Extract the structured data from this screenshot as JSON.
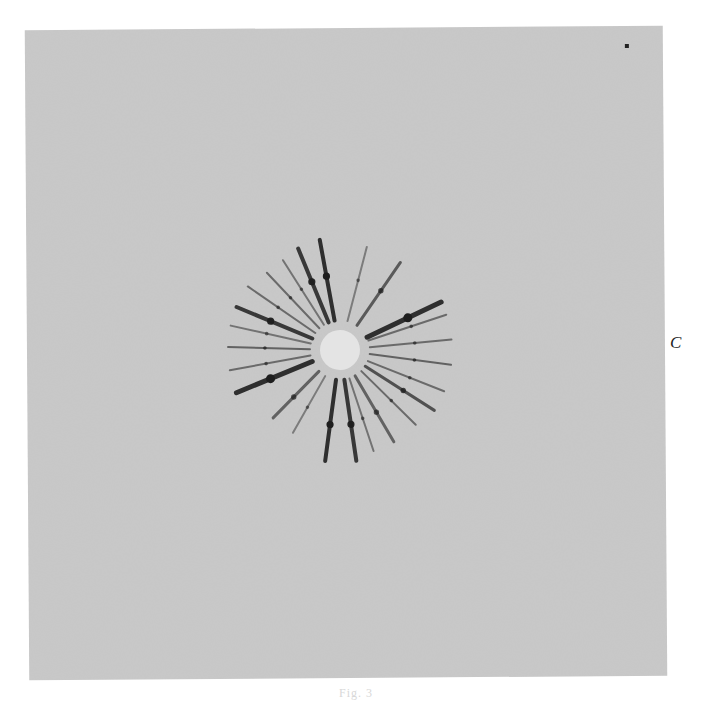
{
  "figure": {
    "side_label": "C",
    "caption": "Fig. 3",
    "plate_color": "#c9c9c9",
    "streak_color": "#1e1e1e",
    "pattern": {
      "center_x": 313,
      "center_y": 322,
      "inner_radius": 22,
      "outer_radius": 112,
      "streaks": [
        {
          "angle": -100,
          "len": 1.0,
          "w": 4,
          "o": 0.9
        },
        {
          "angle": -112,
          "len": 0.98,
          "w": 4,
          "o": 0.85
        },
        {
          "angle": -122,
          "len": 0.95,
          "w": 2,
          "o": 0.5
        },
        {
          "angle": -133,
          "len": 0.95,
          "w": 2,
          "o": 0.55
        },
        {
          "angle": -145,
          "len": 1.0,
          "w": 2,
          "o": 0.55
        },
        {
          "angle": -157,
          "len": 1.0,
          "w": 4,
          "o": 0.85
        },
        {
          "angle": -167,
          "len": 1.0,
          "w": 2,
          "o": 0.5
        },
        {
          "angle": -178,
          "len": 1.0,
          "w": 2,
          "o": 0.6
        },
        {
          "angle": 170,
          "len": 1.0,
          "w": 2,
          "o": 0.55
        },
        {
          "angle": 158,
          "len": 1.0,
          "w": 5,
          "o": 0.9
        },
        {
          "angle": 135,
          "len": 0.85,
          "w": 3,
          "o": 0.6
        },
        {
          "angle": 120,
          "len": 0.85,
          "w": 2,
          "o": 0.45
        },
        {
          "angle": 98,
          "len": 1.0,
          "w": 4,
          "o": 0.9
        },
        {
          "angle": 82,
          "len": 1.0,
          "w": 4,
          "o": 0.85
        },
        {
          "angle": 72,
          "len": 0.95,
          "w": 2,
          "o": 0.5
        },
        {
          "angle": 60,
          "len": 0.95,
          "w": 3,
          "o": 0.6
        },
        {
          "angle": 45,
          "len": 0.95,
          "w": 2,
          "o": 0.55
        },
        {
          "angle": 33,
          "len": 1.0,
          "w": 3,
          "o": 0.7
        },
        {
          "angle": 22,
          "len": 1.0,
          "w": 2,
          "o": 0.55
        },
        {
          "angle": 8,
          "len": 1.0,
          "w": 2,
          "o": 0.6
        },
        {
          "angle": -5,
          "len": 1.0,
          "w": 2,
          "o": 0.55
        },
        {
          "angle": -18,
          "len": 1.0,
          "w": 2,
          "o": 0.55
        },
        {
          "angle": -25,
          "len": 1.0,
          "w": 5,
          "o": 0.9
        },
        {
          "angle": -55,
          "len": 0.95,
          "w": 3,
          "o": 0.65
        },
        {
          "angle": -75,
          "len": 0.95,
          "w": 2,
          "o": 0.45
        }
      ]
    }
  }
}
